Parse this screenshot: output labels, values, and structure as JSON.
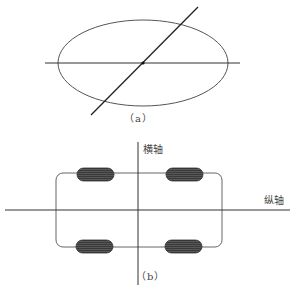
{
  "figure_a": {
    "caption": "（a）",
    "ellipse": {
      "cx": 143,
      "cy": 63,
      "rx": 85,
      "ry": 43
    },
    "horizontal_line": {
      "x1": 45,
      "y1": 63,
      "x2": 240,
      "y2": 63
    },
    "diagonal_line": {
      "x1": 91,
      "y1": 115,
      "x2": 198,
      "y2": 7
    },
    "center_point": {
      "x": 143,
      "y": 63
    }
  },
  "figure_b": {
    "caption": "（b）",
    "vertical_axis_label": "横轴",
    "horizontal_axis_label": "纵轴",
    "vehicle_body": {
      "x": 56,
      "y": 173,
      "width": 166,
      "height": 74,
      "radius": 7
    },
    "wheels": [
      {
        "name": "front-left",
        "x": 77,
        "y": 168,
        "width": 37,
        "height": 13
      },
      {
        "name": "front-right",
        "x": 166,
        "y": 168,
        "width": 37,
        "height": 13
      },
      {
        "name": "rear-left",
        "x": 76,
        "y": 240,
        "width": 37,
        "height": 13
      },
      {
        "name": "rear-right",
        "x": 165,
        "y": 240,
        "width": 37,
        "height": 13
      }
    ]
  },
  "colors": {
    "line": "#333333",
    "wheel_fill": "#3a3a3a",
    "wheel_stripe": "#6a6a6a"
  }
}
